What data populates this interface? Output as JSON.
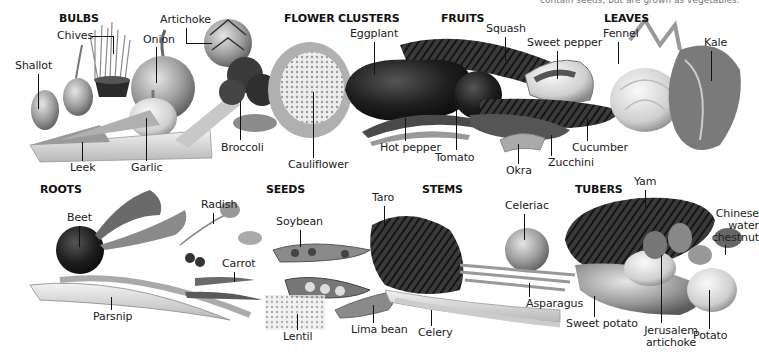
{
  "caption_fragment": "contain seeds, but are grown as vegetables.",
  "groups": {
    "bulbs": "BULBS",
    "flower_clusters": "FLOWER CLUSTERS",
    "fruits": "FRUITS",
    "leaves": "LEAVES",
    "roots": "ROOTS",
    "seeds": "SEEDS",
    "stems": "STEMS",
    "tubers": "TUBERS"
  },
  "labels": {
    "chives": "Chives",
    "artichoke": "Artichoke",
    "onion": "Onion",
    "shallot": "Shallot",
    "leek": "Leek",
    "garlic": "Garlic",
    "broccoli": "Broccoli",
    "cauliflower": "Cauliflower",
    "eggplant": "Eggplant",
    "hot_pepper": "Hot pepper",
    "tomato": "Tomato",
    "squash": "Squash",
    "sweet_pepper": "Sweet pepper",
    "okra": "Okra",
    "zucchini": "Zucchini",
    "cucumber": "Cucumber",
    "fennel": "Fennel",
    "kale": "Kale",
    "beet": "Beet",
    "radish": "Radish",
    "carrot": "Carrot",
    "parsnip": "Parsnip",
    "soybean": "Soybean",
    "lentil": "Lentil",
    "lima_bean": "Lima bean",
    "taro": "Taro",
    "celery": "Celery",
    "celeriac": "Celeriac",
    "asparagus": "Asparagus",
    "yam": "Yam",
    "sweet_potato": "Sweet potato",
    "jerusalem_artichoke": "Jerusalem\nartichoke",
    "potato": "Potato",
    "chinese_water_chestnut": "Chinese\nwater\nchestnut"
  },
  "colors": {
    "background": "#ffffff",
    "text": "#222222",
    "leader_line": "#111111"
  }
}
